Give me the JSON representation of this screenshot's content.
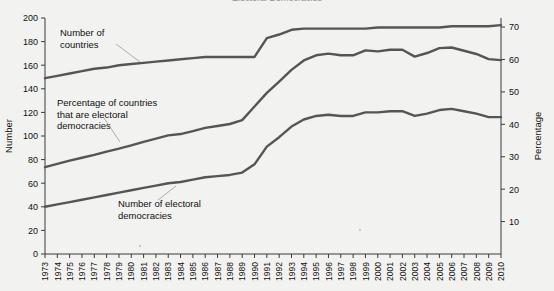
{
  "figure": {
    "title_cropped": "Electoral Democracies",
    "background_color": "#f2f2f0",
    "line_color": "#555555"
  },
  "chart_data": {
    "type": "line",
    "title": "",
    "xlabel": "",
    "ylabel": "Number",
    "y2label": "Percentage",
    "ylim": [
      0,
      200
    ],
    "y2lim": [
      0,
      72.8
    ],
    "yticks": [
      0,
      20,
      40,
      60,
      80,
      100,
      120,
      140,
      160,
      180,
      200
    ],
    "y2ticks": [
      10,
      20,
      30,
      40,
      50,
      60,
      70
    ],
    "grid": false,
    "legend": "annotations-inline",
    "x": [
      1973,
      1974,
      1975,
      1976,
      1977,
      1978,
      1979,
      1980,
      1981,
      1982,
      1983,
      1984,
      1985,
      1986,
      1987,
      1988,
      1989,
      1990,
      1991,
      1992,
      1993,
      1994,
      1995,
      1996,
      1997,
      1998,
      1999,
      2000,
      2001,
      2002,
      2003,
      2004,
      2005,
      2006,
      2007,
      2008,
      2009,
      2010
    ],
    "categories": [
      "1973",
      "1974",
      "1975",
      "1976",
      "1977",
      "1978",
      "1979",
      "1980",
      "1981",
      "1982",
      "1983",
      "1984",
      "1985",
      "1986",
      "1987",
      "1988",
      "1989",
      "1990",
      "1991",
      "1992",
      "1993",
      "1994",
      "1995",
      "1996",
      "1997",
      "1998",
      "1999",
      "2000",
      "2001",
      "2002",
      "2003",
      "2004",
      "2005",
      "2006",
      "2007",
      "2008",
      "2009",
      "2010"
    ],
    "series": [
      {
        "name": "Number of countries",
        "axis": "left",
        "values": [
          149,
          151,
          153,
          155,
          157,
          158,
          160,
          161,
          162,
          163,
          164,
          165,
          166,
          167,
          167,
          167,
          167,
          167,
          183,
          186,
          190,
          191,
          191,
          191,
          191,
          191,
          191,
          192,
          192,
          192,
          192,
          192,
          192,
          193,
          193,
          193,
          193,
          194
        ]
      },
      {
        "name": "Number of electoral democracies",
        "axis": "left",
        "values": [
          40,
          42,
          44,
          46,
          48,
          50,
          52,
          54,
          56,
          58,
          60,
          61,
          63,
          65,
          66,
          67,
          69,
          76,
          91,
          99,
          108,
          114,
          117,
          118,
          117,
          117,
          120,
          120,
          121,
          121,
          117,
          119,
          122,
          123,
          121,
          119,
          116,
          116
        ]
      },
      {
        "name": "Percentage of countries that are electoral democracies",
        "axis": "right",
        "values": [
          26.8,
          27.8,
          28.8,
          29.7,
          30.6,
          31.6,
          32.5,
          33.5,
          34.6,
          35.6,
          36.6,
          37.0,
          37.9,
          38.9,
          39.5,
          40.1,
          41.3,
          45.5,
          49.7,
          53.2,
          56.8,
          59.7,
          61.3,
          61.8,
          61.3,
          61.3,
          62.8,
          62.5,
          63.0,
          63.0,
          60.9,
          62.0,
          63.5,
          63.7,
          62.7,
          61.7,
          60.1,
          59.8
        ]
      }
    ],
    "annotations": [
      {
        "text": "Number of countries",
        "target_series": "Number of countries"
      },
      {
        "text": "Percentage of countries that are electoral democracies",
        "target_series": "Percentage of countries that are electoral democracies"
      },
      {
        "text": "Number of electoral democracies",
        "target_series": "Number of electoral democracies"
      }
    ]
  }
}
